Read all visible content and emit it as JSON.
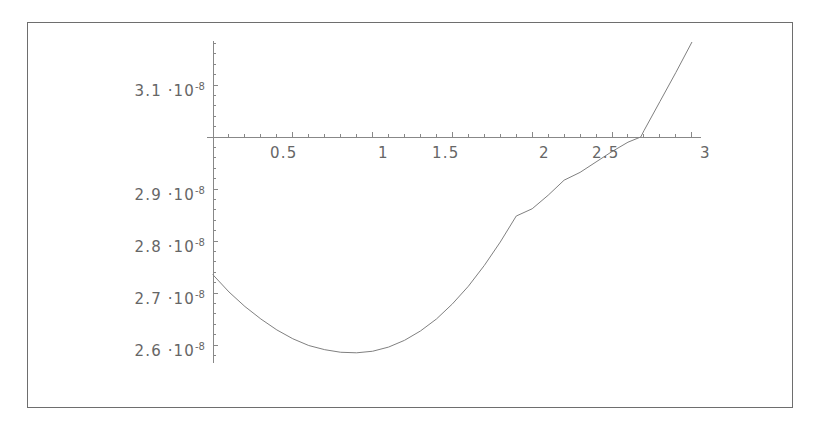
{
  "chart_data": {
    "type": "line",
    "title": "",
    "xlabel": "",
    "ylabel": "",
    "xlim": [
      0,
      3.08
    ],
    "ylim": [
      2.565,
      3.185
    ],
    "grid": false,
    "legend": null,
    "axis_style": "mathematica-cross-axes",
    "x_axis_value": 3e-08,
    "xticks": [
      0.5,
      1,
      1.5,
      2,
      2.5,
      3
    ],
    "xtick_labels": [
      "0.5",
      "1",
      "1.5",
      "2",
      "2.5",
      "3"
    ],
    "xminor_step": 0.1,
    "yticks": [
      3.1e-08,
      2.9e-08,
      2.8e-08,
      2.7e-08,
      2.6e-08
    ],
    "ytick_labels": [
      {
        "mantissa": "3.1",
        "dot": "·",
        "base": "10",
        "exponent": "-8"
      },
      {
        "mantissa": "2.9",
        "dot": "·",
        "base": "10",
        "exponent": "-8"
      },
      {
        "mantissa": "2.8",
        "dot": "·",
        "base": "10",
        "exponent": "-8"
      },
      {
        "mantissa": "2.7",
        "dot": "·",
        "base": "10",
        "exponent": "-8"
      },
      {
        "mantissa": "2.6",
        "dot": "·",
        "base": "10",
        "exponent": "-8"
      }
    ],
    "yminor_step": 2e-10,
    "series": [
      {
        "name": "curve",
        "color": "#808080",
        "x": [
          0.0,
          0.1,
          0.2,
          0.3,
          0.4,
          0.5,
          0.6,
          0.7,
          0.8,
          0.9,
          1.0,
          1.1,
          1.2,
          1.3,
          1.4,
          1.5,
          1.6,
          1.7,
          1.8,
          1.9,
          2.0,
          2.1,
          2.2,
          2.3,
          2.4,
          2.5,
          2.6,
          2.68,
          2.7,
          2.8,
          2.9,
          3.0
        ],
        "y": [
          2.735e-08,
          2.702e-08,
          2.674e-08,
          2.65e-08,
          2.629e-08,
          2.612e-08,
          2.599e-08,
          2.591e-08,
          2.586e-08,
          2.585e-08,
          2.588e-08,
          2.596e-08,
          2.609e-08,
          2.627e-08,
          2.65e-08,
          2.679e-08,
          2.713e-08,
          2.753e-08,
          2.798e-08,
          2.848e-08,
          2.862e-08,
          2.888e-08,
          2.917e-08,
          2.932e-08,
          2.952e-08,
          2.972e-08,
          2.99e-08,
          3e-08,
          3.012e-08,
          3.068e-08,
          3.124e-08,
          3.182e-08
        ]
      }
    ],
    "notes": {
      "minimum_x": 0.9,
      "minimum_y": 2.585e-08,
      "zero_crossing_x": 2.68,
      "start_y": 2.735e-08,
      "end_y": 3.182e-08
    }
  },
  "colors": {
    "frame": "#6e6e6e",
    "axis": "#888888",
    "curve": "#808080",
    "tick_text": "#666666",
    "background": "#ffffff"
  }
}
